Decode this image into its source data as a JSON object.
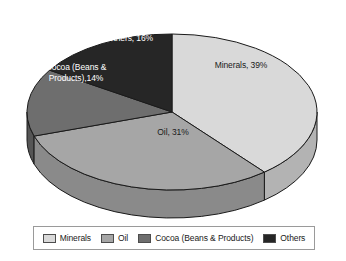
{
  "chart_data": {
    "type": "pie",
    "title": "",
    "categories": [
      "Minerals",
      "Oil",
      "Cocoa (Beans & Products)",
      "Others"
    ],
    "values": [
      39,
      31,
      14,
      16
    ],
    "unit": "%",
    "slice_labels": [
      {
        "line1": "Minerals, 39%",
        "line2": ""
      },
      {
        "line1": "Oil, 31%",
        "line2": ""
      },
      {
        "line1": "Cocoa (Beans &",
        "line2": "Products),14%"
      },
      {
        "line1": "Others, 16%",
        "line2": ""
      }
    ],
    "colors": [
      "#d9d9d9",
      "#a6a6a6",
      "#6e6e6e",
      "#262626"
    ],
    "side_colors": [
      "#b3b3b3",
      "#8a8a8a",
      "#555555",
      "#141414"
    ],
    "label_text_colors": [
      "#1a1a1a",
      "#1a1a1a",
      "#ffffff",
      "#ffffff"
    ],
    "legend_position": "bottom",
    "three_d": true,
    "grid": false
  },
  "legend": {
    "items": [
      {
        "label": "Minerals",
        "color": "#d9d9d9"
      },
      {
        "label": "Oil",
        "color": "#a6a6a6"
      },
      {
        "label": "Cocoa (Beans & Products)",
        "color": "#6e6e6e"
      },
      {
        "label": "Others",
        "color": "#262626"
      }
    ]
  }
}
